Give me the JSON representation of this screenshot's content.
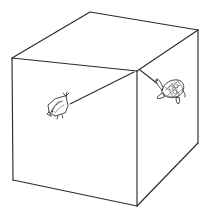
{
  "figure": {
    "title": "Isometric box with two creatures",
    "background_color": "#ffffff",
    "line_color": "#2b2b2b",
    "creature_line_color": "#333333",
    "canvas": {
      "width": 211,
      "height": 216
    }
  },
  "box": {
    "name": "cuboid",
    "label": "box",
    "vertices": {
      "top_left": {
        "x": 12,
        "y": 58
      },
      "top_back": {
        "x": 90,
        "y": 12
      },
      "top_right": {
        "x": 198,
        "y": 30
      },
      "top_near": {
        "x": 137,
        "y": 71
      },
      "bottom_left": {
        "x": 13,
        "y": 180
      },
      "bottom_near": {
        "x": 137,
        "y": 206
      },
      "bottom_right": {
        "x": 198,
        "y": 143
      }
    },
    "faces": [
      {
        "name": "top-face",
        "label": "Top face",
        "points": "12,58 90,12 198,30 137,71"
      },
      {
        "name": "left-face",
        "label": "Left face",
        "points": "12,58 137,71 137,206 13,180"
      },
      {
        "name": "right-face",
        "label": "Right face",
        "points": "137,71 198,30 198,143 137,206"
      }
    ],
    "edges": [
      {
        "name": "edge-top-left-back",
        "path": "M 12 58 L 90 12"
      },
      {
        "name": "edge-top-back-right",
        "path": "M 90 12 L 198 30"
      },
      {
        "name": "edge-top-right-near",
        "path": "M 198 30 L 137 71"
      },
      {
        "name": "edge-top-near-left",
        "path": "M 137 71 L 12 58"
      },
      {
        "name": "edge-vertical-left",
        "path": "M 12 58 L 13 180"
      },
      {
        "name": "edge-vertical-near",
        "path": "M 137 71 L 137 206"
      },
      {
        "name": "edge-vertical-right",
        "path": "M 198 30 L 198 143"
      },
      {
        "name": "edge-bottom-left-near",
        "path": "M 13 180 L 137 206"
      },
      {
        "name": "edge-bottom-near-right",
        "path": "M 137 206 L 198 143"
      }
    ]
  },
  "leader_lines": [
    {
      "name": "leader-to-bird",
      "label": "line to bird",
      "path": "M 134 72 L 70 104",
      "from": {
        "x": 134,
        "y": 72
      },
      "to": {
        "x": 70,
        "y": 104
      }
    },
    {
      "name": "leader-to-turtle",
      "label": "line to turtle",
      "path": "M 140 70 L 163 88",
      "from": {
        "x": 140,
        "y": 70
      },
      "to": {
        "x": 163,
        "y": 88
      }
    }
  ],
  "creatures": [
    {
      "name": "bird-figure",
      "label": "bird",
      "position": {
        "x": 48,
        "y": 96
      },
      "size": {
        "width": 26,
        "height": 24
      },
      "face": "left-face"
    },
    {
      "name": "turtle-figure",
      "label": "turtle",
      "position": {
        "x": 154,
        "y": 82
      },
      "size": {
        "width": 32,
        "height": 26
      },
      "face": "right-face"
    }
  ]
}
